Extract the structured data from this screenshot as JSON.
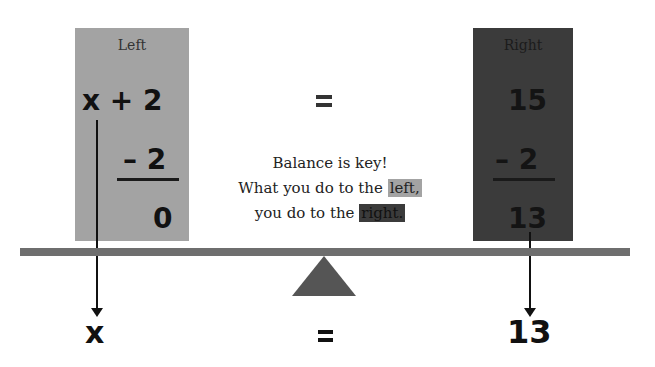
{
  "left_panel": {
    "title": "Left",
    "expression": "x + 2",
    "subtract": "– 2",
    "result": "0",
    "color": "#a3a3a3"
  },
  "middle": {
    "equals": "="
  },
  "right_panel": {
    "title": "Right",
    "value": "15",
    "subtract": "– 2",
    "result": "13",
    "color": "#3b3b3b"
  },
  "caption": {
    "line1": "Balance is key!",
    "line2_prefix": "What you do to the ",
    "line2_highlight": "left,",
    "line3_prefix": "you do to the ",
    "line3_highlight": "right."
  },
  "balance": {
    "beam_color": "#6e6e6e",
    "fulcrum_color": "#555555"
  },
  "solution": {
    "left": "x",
    "equals": "=",
    "right": "13"
  }
}
